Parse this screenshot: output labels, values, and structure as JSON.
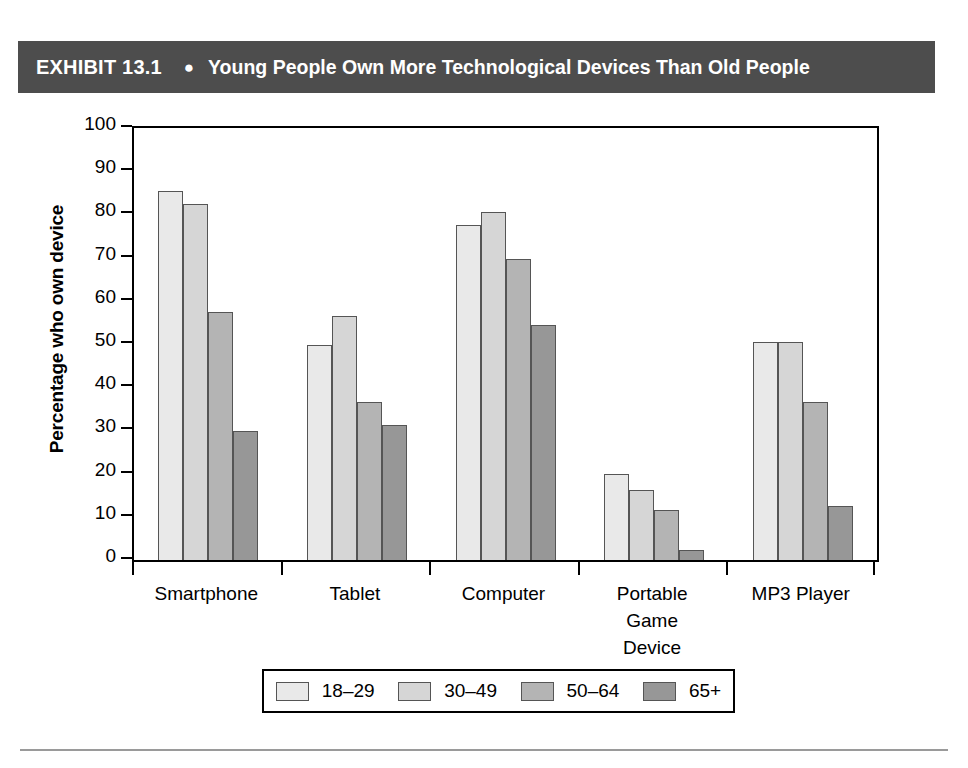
{
  "banner": {
    "exhibit_label": "EXHIBIT 13.1",
    "bullet": "●",
    "title": "Young People Own More Technological Devices Than Old People",
    "background_color": "#4d4d4d",
    "text_color": "#ffffff"
  },
  "chart_data": {
    "type": "bar",
    "title": "Young People Own More Technological Devices Than Old People",
    "xlabel": "",
    "ylabel": "Percentage who own device",
    "ylim": [
      0,
      100
    ],
    "ytick_step": 10,
    "yticks": [
      100,
      90,
      80,
      70,
      60,
      50,
      40,
      30,
      20,
      10,
      0
    ],
    "grid": false,
    "legend_position": "bottom",
    "categories": [
      "Smartphone",
      "Tablet",
      "Computer",
      "Portable Game Device",
      "MP3 Player"
    ],
    "category_label_lines": [
      [
        "Smartphone"
      ],
      [
        "Tablet"
      ],
      [
        "Computer"
      ],
      [
        "Portable",
        "Game",
        "Device"
      ],
      [
        "MP3 Player"
      ]
    ],
    "series": [
      {
        "name": "18–29",
        "color": "#e9e9e9",
        "values": [
          85.5,
          49.8,
          77.5,
          20.0,
          50.5
        ]
      },
      {
        "name": "30–49",
        "color": "#d6d6d6",
        "values": [
          82.5,
          56.5,
          80.5,
          16.2,
          50.5
        ]
      },
      {
        "name": "50–64",
        "color": "#b4b4b4",
        "values": [
          57.5,
          36.5,
          69.7,
          11.5,
          36.5
        ]
      },
      {
        "name": "65+",
        "color": "#979797",
        "values": [
          29.8,
          31.3,
          54.3,
          2.4,
          12.4
        ]
      }
    ]
  },
  "legend": {
    "entries": [
      "18–29",
      "30–49",
      "50–64",
      "65+"
    ]
  }
}
